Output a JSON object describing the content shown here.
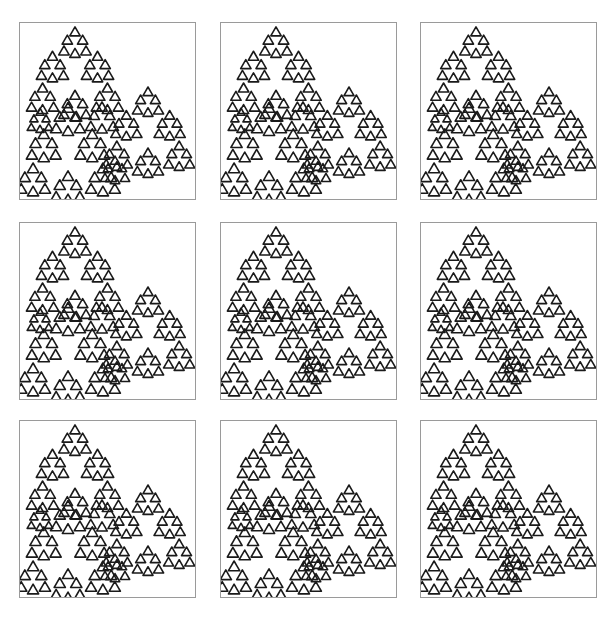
{
  "figure": {
    "rows": 3,
    "cols": 3,
    "panels": [
      {
        "id": "panel-1",
        "row": 1,
        "col": 1
      },
      {
        "id": "panel-2",
        "row": 1,
        "col": 2
      },
      {
        "id": "panel-3",
        "row": 1,
        "col": 3
      },
      {
        "id": "panel-4",
        "row": 2,
        "col": 1
      },
      {
        "id": "panel-5",
        "row": 2,
        "col": 2
      },
      {
        "id": "panel-6",
        "row": 2,
        "col": 3
      },
      {
        "id": "panel-7",
        "row": 3,
        "col": 1
      },
      {
        "id": "panel-8",
        "row": 3,
        "col": 2
      },
      {
        "id": "panel-9",
        "row": 3,
        "col": 3
      }
    ],
    "colors": {
      "fractal": "#1a1a1a",
      "border": "#9a9a9a",
      "background": "#ffffff"
    }
  }
}
